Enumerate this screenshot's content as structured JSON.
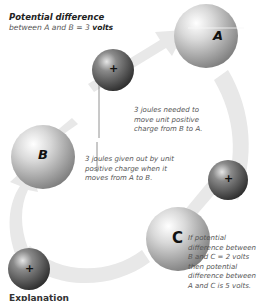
{
  "header": {
    "title": "Potential difference",
    "subtitle_prefix": "between A and B = 3 ",
    "subtitle_bold": "volts"
  },
  "spheres": {
    "A": {
      "label": "A"
    },
    "B": {
      "label": "B"
    },
    "C": {
      "label": "C"
    }
  },
  "charges": {
    "symbol": "+"
  },
  "notes": {
    "b_to_a": [
      "3 joules needed to",
      "move unit positive",
      "charge from B to A."
    ],
    "a_to_b": [
      "3 joules given out by unit",
      "positive charge when it",
      "moves from A to B."
    ],
    "c_note": [
      "If potential",
      "difference between",
      "B and C = 2 volts",
      "then potential",
      "difference between",
      "A and C is 5 volts."
    ]
  },
  "footer": {
    "partial_heading": "Explanation"
  },
  "colors": {
    "arrow": "#e6e6e6",
    "sphere_light": "#f4f4f4",
    "sphere_dark": "#7a7a7a",
    "charge_dark": "#3a3a3a",
    "text": "#555555"
  }
}
